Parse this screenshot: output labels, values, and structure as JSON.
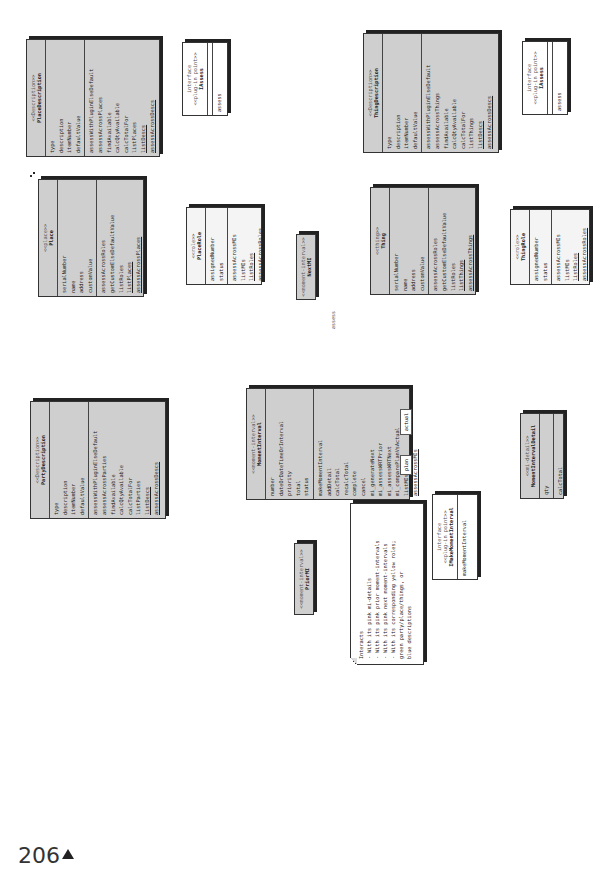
{
  "page": {
    "number": "206",
    "marker": "▲"
  },
  "classes": {
    "party": {
      "stereotype": "<<party>>",
      "name": "Party",
      "attributes": [
        "serialNumber",
        "name",
        "address",
        "customValue"
      ],
      "methods": [
        "assessAcrossRoles",
        "getCustomElseDefaultValue",
        "listRoles",
        "listParties",
        "assessAcrossParties"
      ]
    },
    "partyDescription": {
      "stereotype": "<<Description>>",
      "name": "PartyDescription",
      "attributes": [
        "type",
        "description",
        "itemNumber",
        "defaultValue"
      ],
      "methods": [
        "assessWithPluginElseDefault",
        "assessAcrossParties",
        "findAvailable",
        "calcQtyAvailable",
        "calcTotalFor",
        "listParties",
        "listDescs",
        "assessAcrossDescs"
      ]
    },
    "partyRole": {
      "stereotype": "<<role>>",
      "name": "PartyRole",
      "attributes": [
        "assignedNumber",
        "status"
      ],
      "methods": [
        "assessAcrossMIs",
        "listMIs",
        "listRoles",
        "assessAcrossRoles"
      ]
    },
    "momentInterval": {
      "stereotype": "<<moment-interval>>",
      "name": "MomentInterval",
      "attributes": [
        "number",
        "dateOrDateTimeOrInterval",
        "priority",
        "total",
        "status"
      ],
      "methods": [
        "makeMomentInterval",
        "addDetail",
        "calcTotal",
        "recalcTotal",
        "complete",
        "cancel",
        "mi_generateNext",
        "mi_assessWRTPrior",
        "mi_assessWRTNext",
        "mi_comparePlanVsActual",
        "listMIs",
        "assessAcrossMIs"
      ]
    },
    "priorMI": {
      "stereotype": "<<moment-interval>>",
      "name": "PriorMI"
    },
    "nextMI": {
      "stereotype": "<<moment-interval>>",
      "name": "NextMI",
      "methods": [
        "assess"
      ]
    },
    "place": {
      "stereotype": "<<place>>",
      "name": "Place",
      "attributes": [
        "serialNumber",
        "name",
        "address",
        "customValue"
      ],
      "methods": [
        "assessAcrossRoles",
        "getCustomElseDefaultValue",
        "listRoles",
        "listPlaces",
        "assessAcrossPlaces"
      ]
    },
    "placeDescription": {
      "stereotype": "<<Description>>",
      "name": "PlaceDescription",
      "attributes": [
        "type",
        "description",
        "itemNumber",
        "defaultValue"
      ],
      "methods": [
        "assessWithPluginElseDefault",
        "assessAcrossPlaces",
        "findAvailable",
        "calcQtyAvailable",
        "calcTotalFor",
        "listPlaces",
        "listDescs",
        "assessAcrossDescs"
      ]
    },
    "placeRole": {
      "stereotype": "<<role>>",
      "name": "PlaceRole",
      "attributes": [
        "assignedNumber",
        "status"
      ],
      "methods": [
        "assessAcrossMIs",
        "listMIs",
        "listRoles",
        "assessAcrossRoles"
      ]
    },
    "thing": {
      "stereotype": "<<thing>>",
      "name": "Thing",
      "attributes": [
        "serialNumber",
        "name",
        "address",
        "customValue"
      ],
      "methods": [
        "assessAcrossRoles",
        "getCustomElseDefaultValue",
        "listRoles",
        "listThings",
        "assessAcrossThings"
      ]
    },
    "thingDescription": {
      "stereotype": "<<Description>>",
      "name": "ThingDescription",
      "attributes": [
        "type",
        "description",
        "itemNumber",
        "defaultValue"
      ],
      "methods": [
        "assessWithPluginElseDefault",
        "assessAcrossThings",
        "findAvailable",
        "calcQtyAvailable",
        "calcTotalFor",
        "listThings",
        "listDescs",
        "assessAcrossDescs"
      ]
    },
    "thingRole": {
      "stereotype": "<<role>>",
      "name": "ThingRole",
      "attributes": [
        "assignedNumber",
        "status"
      ],
      "methods": [
        "assessAcrossMIs",
        "listMIs",
        "listRoles",
        "assessAcrossRoles"
      ]
    },
    "miDetail": {
      "stereotype": "<<mi-detail>>",
      "name": "MomentIntervalDetail",
      "attributes": [
        "qty"
      ],
      "methods": [
        "calcTotal"
      ]
    }
  },
  "interfaces": {
    "partyAssess": {
      "label": "interface",
      "stereotype": "<<plug-in point>>",
      "name": "IAssess",
      "methods": [
        "assess"
      ]
    },
    "placeAssess": {
      "label": "interface",
      "stereotype": "<<plug-in point>>",
      "name": "IAssess",
      "methods": [
        "assess"
      ]
    },
    "thingAssess": {
      "label": "interface",
      "stereotype": "<<plug-in point>>",
      "name": "IAssess",
      "methods": [
        "assess"
      ]
    },
    "makeMI": {
      "label": "interface",
      "stereotype": "<<plug-in point>>",
      "name": "IMakeMomentInterval",
      "methods": [
        "makeMomentInterval"
      ]
    }
  },
  "planActual": {
    "actual": "actual",
    "plan": "plan"
  },
  "notes": {
    "mi": [
      "Interacts",
      "- With its pink mi-details",
      "- With its pink prior moment-intervals",
      "- With its pink next moment-intervals",
      "- With its corresponding yellow roles;",
      "green party/place/things, or",
      "blue descriptions"
    ],
    "party": [
      "Interacts with its",
      "yellow roles or its",
      "pink moment-intervals"
    ],
    "partyDesc": [
      "Interacts with its",
      "green parties or",
      "its pink moment-",
      "intervals"
    ],
    "partyRole": [
      "Interacts",
      "with its pink",
      "moment-intervals"
    ]
  },
  "multiplicities": {
    "one": "1",
    "zeroOne": "0..1",
    "zeroMany": "0..*",
    "oneMany": "1..*"
  }
}
